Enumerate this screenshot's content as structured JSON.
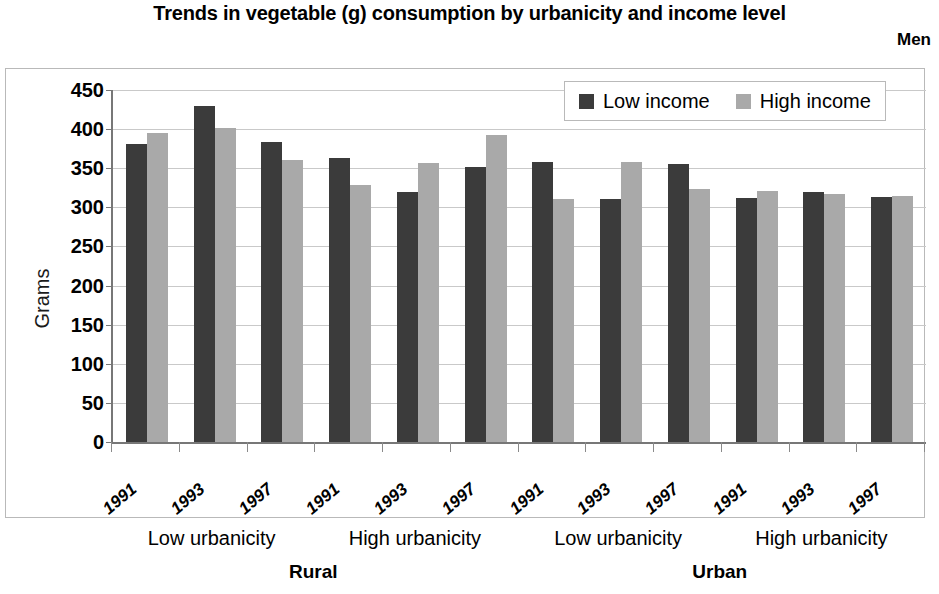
{
  "chart_data": {
    "type": "bar",
    "title": "Trends in vegetable (g) consumption by urbanicity and income level",
    "subtitle": "Men",
    "xlabel": "",
    "ylabel": "Grams",
    "ylim": [
      0,
      450
    ],
    "ytick_step": 50,
    "yticks": [
      450,
      400,
      350,
      300,
      250,
      200,
      150,
      100,
      50,
      0
    ],
    "grid": true,
    "legend_position": "top-right",
    "colors": {
      "low_income": "#3b3b3b",
      "high_income": "#a9a9a9",
      "gridline": "#c9c9c9",
      "axis": "#777777",
      "frame": "#b9b9b9",
      "background": "#ffffff"
    },
    "legend": [
      {
        "name": "Low income",
        "color": "#3b3b3b"
      },
      {
        "name": "High income",
        "color": "#a9a9a9"
      }
    ],
    "series": [
      {
        "name": "Low income",
        "values": [
          381,
          429,
          384,
          363,
          320,
          351,
          358,
          311,
          356,
          312,
          319,
          313
        ]
      },
      {
        "name": "High income",
        "values": [
          395,
          401,
          361,
          328,
          357,
          392,
          311,
          358,
          323,
          321,
          317,
          314
        ]
      }
    ],
    "categories": [
      "1991",
      "1993",
      "1997",
      "1991",
      "1993",
      "1997",
      "1991",
      "1993",
      "1997",
      "1991",
      "1993",
      "1997"
    ],
    "groups": [
      {
        "region": "Rural",
        "urbanicity_groups": [
          {
            "urbanicity": "Low urbanicity",
            "years": [
              "1991",
              "1993",
              "1997"
            ],
            "low_income": [
              381,
              429,
              384
            ],
            "high_income": [
              395,
              401,
              361
            ]
          },
          {
            "urbanicity": "High urbanicity",
            "years": [
              "1991",
              "1993",
              "1997"
            ],
            "low_income": [
              363,
              320,
              351
            ],
            "high_income": [
              328,
              357,
              392
            ]
          }
        ]
      },
      {
        "region": "Urban",
        "urbanicity_groups": [
          {
            "urbanicity": "Low urbanicity",
            "years": [
              "1991",
              "1993",
              "1997"
            ],
            "low_income": [
              358,
              311,
              356
            ],
            "high_income": [
              311,
              358,
              323
            ]
          },
          {
            "urbanicity": "High urbanicity",
            "years": [
              "1991",
              "1993",
              "1997"
            ],
            "low_income": [
              312,
              319,
              313
            ],
            "high_income": [
              321,
              317,
              314
            ]
          }
        ]
      }
    ]
  },
  "axis": {
    "y_title": "Grams",
    "y_labels": [
      "450",
      "400",
      "350",
      "300",
      "250",
      "200",
      "150",
      "100",
      "50",
      "0"
    ]
  },
  "legend": {
    "low_label": "Low income",
    "high_label": "High income"
  },
  "labels": {
    "urbanicity": [
      "Low urbanicity",
      "High urbanicity",
      "Low urbanicity",
      "High urbanicity"
    ],
    "regions": [
      "Rural",
      "Urban"
    ],
    "years": [
      "1991",
      "1993",
      "1997",
      "1991",
      "1993",
      "1997",
      "1991",
      "1993",
      "1997",
      "1991",
      "1993",
      "1997"
    ]
  }
}
